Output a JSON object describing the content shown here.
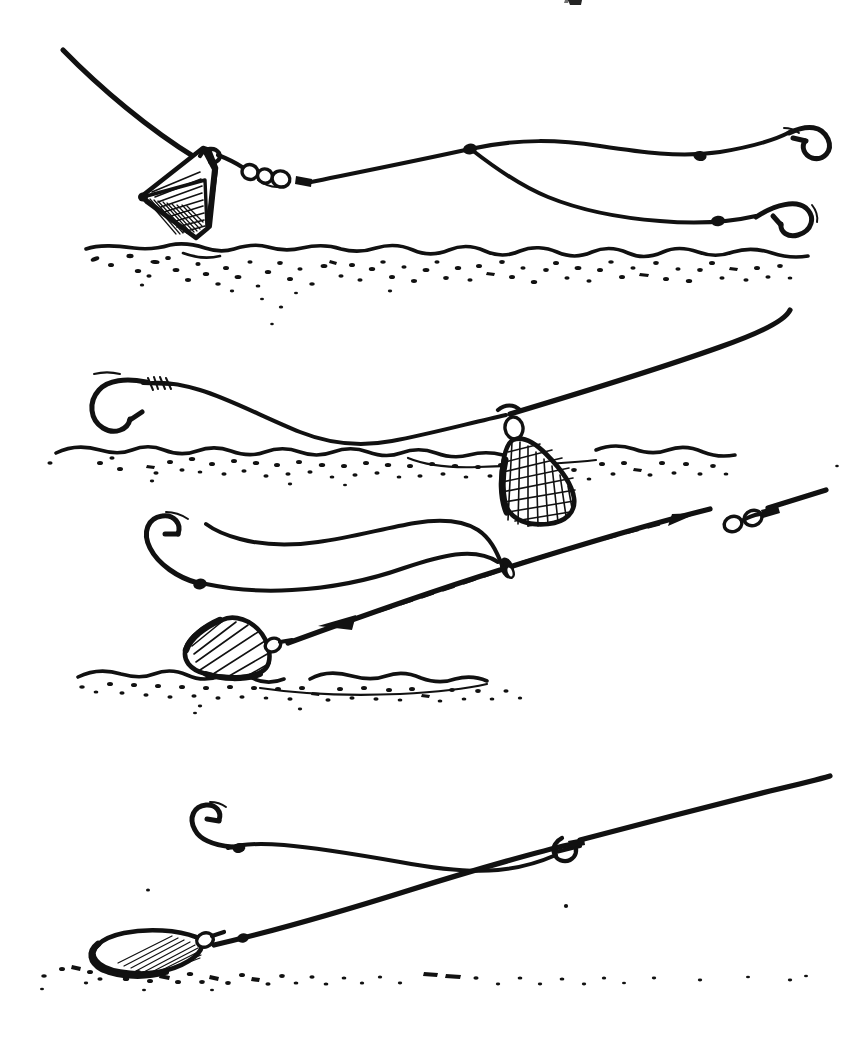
{
  "figure": {
    "kind": "line-drawing",
    "background_color": "#ffffff",
    "ink_color": "#111111",
    "width": 858,
    "height": 1051,
    "panel_count": 4,
    "top_edge_artifact": "cropped ink fragment of text from the line above"
  },
  "panels": [
    {
      "id": "panel-1",
      "name": "pyramid-lead-two-hook-flapper",
      "label": "",
      "elements": [
        {
          "name": "main-line-to-rod",
          "kind": "line"
        },
        {
          "name": "pyramid-lead-weight",
          "kind": "lead",
          "shape": "pyramid",
          "hatched": true
        },
        {
          "name": "lead-swivel-link",
          "kind": "swivel"
        },
        {
          "name": "snood-upper",
          "kind": "hooklength"
        },
        {
          "name": "snood-lower",
          "kind": "hooklength"
        },
        {
          "name": "stop-bead-upper",
          "kind": "bead"
        },
        {
          "name": "stop-bead-lower",
          "kind": "bead"
        },
        {
          "name": "hook-upper",
          "kind": "hook",
          "point_direction": "up-left"
        },
        {
          "name": "hook-lower",
          "kind": "hook",
          "point_direction": "up-left"
        },
        {
          "name": "seabed",
          "kind": "ground",
          "texture": "stippled-sand"
        }
      ]
    },
    {
      "id": "panel-2",
      "name": "pear-lead-fixed-paternoster",
      "label": "",
      "elements": [
        {
          "name": "main-line-to-rod",
          "kind": "line"
        },
        {
          "name": "pear-lead-weight",
          "kind": "lead",
          "shape": "pear",
          "hatched": true
        },
        {
          "name": "lead-swivel-loop",
          "kind": "swivel"
        },
        {
          "name": "snood",
          "kind": "hooklength"
        },
        {
          "name": "whipping-knot",
          "kind": "knot"
        },
        {
          "name": "hook",
          "kind": "hook",
          "point_direction": "up-right"
        },
        {
          "name": "seabed",
          "kind": "ground",
          "texture": "stippled-sand"
        }
      ]
    },
    {
      "id": "panel-3",
      "name": "running-lead-sliding-rig",
      "label": "",
      "elements": [
        {
          "name": "main-line-to-rod",
          "kind": "line"
        },
        {
          "name": "rotten-bottom-lead",
          "kind": "lead",
          "shape": "wedge",
          "hatched": true
        },
        {
          "name": "sliding-ring-bead",
          "kind": "ring"
        },
        {
          "name": "barrel-swivel",
          "kind": "swivel"
        },
        {
          "name": "snood",
          "kind": "hooklength"
        },
        {
          "name": "stop-bead",
          "kind": "bead"
        },
        {
          "name": "hook",
          "kind": "hook",
          "point_direction": "up-right"
        },
        {
          "name": "movement-arrow-up-right",
          "kind": "arrow",
          "direction": "up-right",
          "style": "dashed"
        },
        {
          "name": "movement-arrow-down-left",
          "kind": "arrow",
          "direction": "down-left",
          "style": "dashed"
        },
        {
          "name": "seabed",
          "kind": "ground",
          "texture": "stippled-sand"
        }
      ]
    },
    {
      "id": "panel-4",
      "name": "flat-oval-lead-lying-on-bottom",
      "label": "",
      "elements": [
        {
          "name": "main-line-to-rod",
          "kind": "line"
        },
        {
          "name": "flat-oval-lead-weight",
          "kind": "lead",
          "shape": "flat-oval",
          "hatched": true
        },
        {
          "name": "lead-eye-swivel",
          "kind": "swivel"
        },
        {
          "name": "line-stop-bead",
          "kind": "bead"
        },
        {
          "name": "snood-loop-connector",
          "kind": "loop"
        },
        {
          "name": "snood",
          "kind": "hooklength"
        },
        {
          "name": "stop-bead",
          "kind": "bead"
        },
        {
          "name": "hook",
          "kind": "hook",
          "point_direction": "up-right"
        },
        {
          "name": "seabed",
          "kind": "ground",
          "texture": "sparse-stipple"
        }
      ]
    }
  ]
}
